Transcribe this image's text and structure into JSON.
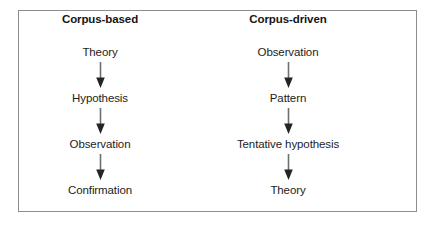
{
  "diagram": {
    "frame_border_color": "#8d8d8d",
    "background_color": "#ffffff",
    "text_color": "#1d1d1d",
    "arrow_shaft_color": "#6f6f6f",
    "arrow_head_color": "#242424",
    "arrow_icon_name": "down-arrow-icon",
    "columns": [
      {
        "heading": "Corpus-based",
        "steps": [
          {
            "label": "Theory"
          },
          {
            "label": "Hypothesis"
          },
          {
            "label": "Observation"
          },
          {
            "label": "Confirmation"
          }
        ]
      },
      {
        "heading": "Corpus-driven",
        "steps": [
          {
            "label": "Observation"
          },
          {
            "label": "Pattern"
          },
          {
            "label": "Tentative hypothesis"
          },
          {
            "label": "Theory"
          }
        ]
      }
    ]
  }
}
